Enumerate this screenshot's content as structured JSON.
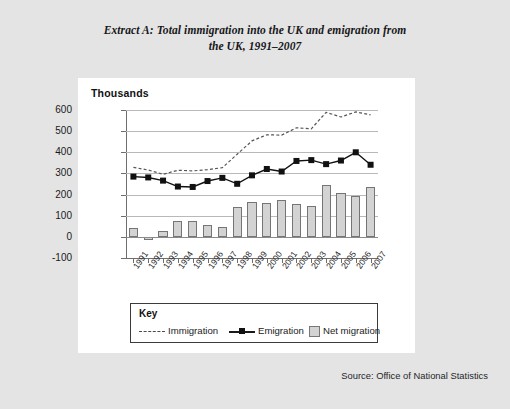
{
  "document": {
    "title_line1": "Extract A: Total immigration into the UK and emigration from",
    "title_line2": "the UK, 1991–2007",
    "source": "Source: Office of National Statistics"
  },
  "chart": {
    "unit_label": "Thousands",
    "key_heading": "Key",
    "legend": [
      {
        "label": "Immigration",
        "style": "dotted-line",
        "color": "#4a4a4a"
      },
      {
        "label": "Emigration",
        "style": "solid-line-square-marker",
        "color": "#111111"
      },
      {
        "label": "Net migration",
        "style": "filled-bar",
        "color": "#d3d3d3"
      }
    ]
  },
  "chart_data": {
    "type": "bar",
    "title": "Extract A: Total immigration into the UK and emigration from the UK, 1991–2007",
    "xlabel": "",
    "ylabel": "Thousands",
    "ylim": [
      -100,
      600
    ],
    "yticks": [
      -100,
      0,
      100,
      200,
      300,
      400,
      500,
      600
    ],
    "grid": true,
    "legend_position": "below-plot",
    "categories": [
      "1991",
      "1992",
      "1993",
      "1994",
      "1995",
      "1996",
      "1997",
      "1998",
      "1999",
      "2000",
      "2001",
      "2002",
      "2003",
      "2004",
      "2005",
      "2006",
      "2007"
    ],
    "series": [
      {
        "name": "Immigration",
        "type": "line",
        "style": "dotted",
        "values": [
          329,
          316,
          296,
          315,
          312,
          318,
          327,
          391,
          454,
          483,
          481,
          516,
          511,
          589,
          567,
          591,
          577
        ]
      },
      {
        "name": "Emigration",
        "type": "line",
        "style": "solid-with-square-markers",
        "values": [
          285,
          281,
          266,
          238,
          236,
          264,
          279,
          251,
          291,
          321,
          309,
          359,
          363,
          344,
          361,
          400,
          341
        ]
      },
      {
        "name": "Net migration",
        "type": "bar",
        "values": [
          44,
          -13,
          30,
          77,
          76,
          54,
          48,
          140,
          163,
          162,
          172,
          157,
          148,
          245,
          206,
          191,
          236
        ]
      }
    ]
  }
}
